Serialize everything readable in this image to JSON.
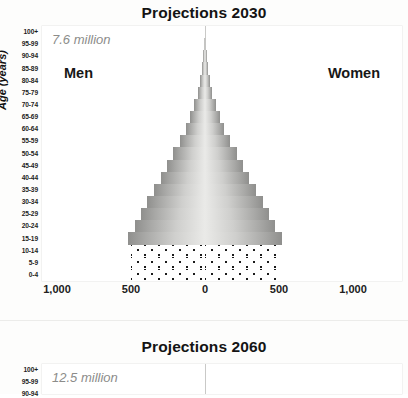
{
  "chart_data": [
    {
      "type": "bar",
      "title": "Projections 2030",
      "subtitle": "7.6 million",
      "xlabel": "",
      "ylabel": "Age (years)",
      "orientation": "population-pyramid",
      "grid": false,
      "legend_position": "inline",
      "xlim": [
        -1250,
        1250
      ],
      "xticks": [
        1000,
        500,
        0,
        500,
        1000
      ],
      "xtick_labels": [
        "1,000",
        "500",
        "0",
        "500",
        "1,000"
      ],
      "categories": [
        "0-4",
        "5-9",
        "10-14",
        "15-19",
        "20-24",
        "25-29",
        "30-34",
        "35-39",
        "40-44",
        "45-49",
        "50-54",
        "55-59",
        "60-64",
        "65-69",
        "70-74",
        "75-79",
        "80-84",
        "85-89",
        "90-94",
        "95-99",
        "100+"
      ],
      "series": [
        {
          "name": "Men",
          "side": "left",
          "values": [
            500,
            500,
            500,
            520,
            470,
            430,
            390,
            345,
            300,
            255,
            215,
            170,
            130,
            100,
            72,
            50,
            34,
            22,
            13,
            6,
            2
          ]
        },
        {
          "name": "Women",
          "side": "right",
          "values": [
            500,
            500,
            500,
            520,
            470,
            430,
            390,
            345,
            300,
            255,
            215,
            170,
            130,
            100,
            72,
            50,
            34,
            22,
            13,
            6,
            2
          ]
        }
      ],
      "annotations": {
        "men_label": "Men",
        "women_label": "Women"
      },
      "styles": {
        "dotted_categories": [
          "0-4",
          "5-9",
          "10-14"
        ],
        "bar_fill_note": "gradient light at center to dark at outer edge"
      }
    },
    {
      "type": "bar",
      "title": "Projections 2060",
      "subtitle": "12.5 million",
      "ylabel": "Age (years)",
      "orientation": "population-pyramid",
      "truncated": true,
      "categories": [
        "100+",
        "95-99",
        "90-94"
      ],
      "series": [
        {
          "name": "Men",
          "side": "left",
          "values": []
        },
        {
          "name": "Women",
          "side": "right",
          "values": []
        }
      ]
    }
  ],
  "panel_2030": {
    "title": "Projections 2030",
    "total": "7.6 million",
    "men": "Men",
    "women": "Women",
    "axis_title": "Age (years)",
    "age_ticks": [
      "100+",
      "95-99",
      "90-94",
      "85-89",
      "80-84",
      "75-79",
      "70-74",
      "65-69",
      "60-64",
      "55-59",
      "50-54",
      "45-49",
      "40-44",
      "35-39",
      "30-34",
      "25-29",
      "20-24",
      "15-19",
      "10-14",
      "5-9",
      "0-4"
    ],
    "x_ticks": [
      "1,000",
      "500",
      "0",
      "500",
      "1,000"
    ]
  },
  "panel_2060": {
    "title": "Projections 2060",
    "total": "12.5 million",
    "axis_title": "Age (years)",
    "age_ticks": [
      "100+",
      "95-99",
      "90-94"
    ]
  },
  "colors": {
    "bar_dark": "#8f8f8d",
    "bar_light": "#eaeae8",
    "axis_line": "#c9c9c7",
    "text": "#1a1a1a",
    "muted_text": "#8c8c8a",
    "background": "#ffffff"
  }
}
